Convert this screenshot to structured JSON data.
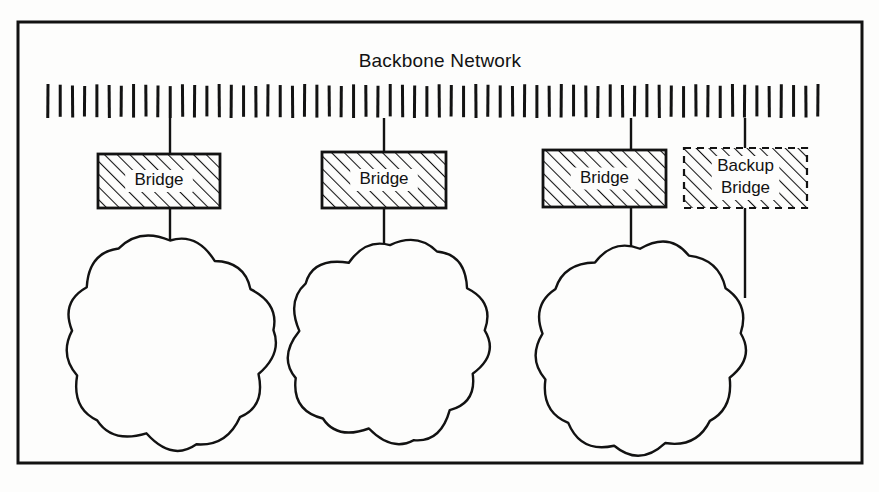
{
  "figure": {
    "title": "Backbone Network",
    "background_color": "#fdfdfc",
    "ink_color": "#121212",
    "frame": {
      "name": "outer-border",
      "x": 18,
      "y": 22,
      "width": 844,
      "height": 441,
      "stroke_width": 3
    }
  },
  "backbone": {
    "label": "Backbone Network",
    "name": "backbone-network-bar",
    "x": 48,
    "y": 84,
    "width": 770,
    "height": 34,
    "tick_count": 64,
    "tick_width": 3,
    "style": "vertical-hatch-band"
  },
  "bridges": [
    {
      "id": "bridge-1",
      "label": "Bridge",
      "lines": [
        "Bridge"
      ],
      "kind": "primary",
      "border": "solid",
      "fill": "diagonal-hatch",
      "x": 98,
      "y": 154,
      "width": 122,
      "height": 54,
      "uplink_x": 170,
      "downlink_x": 170
    },
    {
      "id": "bridge-2",
      "label": "Bridge",
      "lines": [
        "Bridge"
      ],
      "kind": "primary",
      "border": "solid",
      "fill": "diagonal-hatch",
      "x": 322,
      "y": 152,
      "width": 124,
      "height": 56,
      "uplink_x": 384,
      "downlink_x": 384
    },
    {
      "id": "bridge-3",
      "label": "Bridge",
      "lines": [
        "Bridge"
      ],
      "kind": "primary",
      "border": "solid",
      "fill": "diagonal-hatch",
      "x": 543,
      "y": 150,
      "width": 123,
      "height": 57,
      "uplink_x": 631,
      "downlink_x": 631
    },
    {
      "id": "backup-bridge",
      "label": "Backup Bridge",
      "lines": [
        "Backup",
        "Bridge"
      ],
      "kind": "backup",
      "border": "dashed",
      "fill": "diagonal-hatch",
      "x": 684,
      "y": 148,
      "width": 123,
      "height": 60,
      "uplink_x": 745,
      "downlink_x": 745
    }
  ],
  "clouds": [
    {
      "id": "cloud-1",
      "name": "network-cloud-1",
      "cx": 170,
      "cy": 342,
      "rx": 105,
      "ry": 100,
      "connected_bridges": [
        "bridge-1"
      ]
    },
    {
      "id": "cloud-2",
      "name": "network-cloud-2",
      "cx": 390,
      "cy": 342,
      "rx": 97,
      "ry": 98,
      "connected_bridges": [
        "bridge-2"
      ]
    },
    {
      "id": "cloud-3",
      "name": "network-cloud-3",
      "cx": 640,
      "cy": 345,
      "rx": 104,
      "ry": 100,
      "connected_bridges": [
        "bridge-3",
        "backup-bridge"
      ]
    }
  ],
  "links": [
    {
      "id": "link-backbone-bridge-1",
      "from": "backbone",
      "to": "bridge-1",
      "x1": 170,
      "y1": 118,
      "x2": 170,
      "y2": 154
    },
    {
      "id": "link-bridge-1-cloud-1",
      "from": "bridge-1",
      "to": "cloud-1",
      "x1": 170,
      "y1": 208,
      "x2": 170,
      "y2": 254
    },
    {
      "id": "link-backbone-bridge-2",
      "from": "backbone",
      "to": "bridge-2",
      "x1": 384,
      "y1": 118,
      "x2": 384,
      "y2": 152
    },
    {
      "id": "link-bridge-2-cloud-2",
      "from": "bridge-2",
      "to": "cloud-2",
      "x1": 384,
      "y1": 208,
      "x2": 384,
      "y2": 262
    },
    {
      "id": "link-backbone-bridge-3",
      "from": "backbone",
      "to": "bridge-3",
      "x1": 631,
      "y1": 118,
      "x2": 631,
      "y2": 150
    },
    {
      "id": "link-bridge-3-cloud-3",
      "from": "bridge-3",
      "to": "cloud-3",
      "x1": 631,
      "y1": 207,
      "x2": 631,
      "y2": 280
    },
    {
      "id": "link-backbone-backup-bridge",
      "from": "backbone",
      "to": "backup-bridge",
      "x1": 745,
      "y1": 118,
      "x2": 745,
      "y2": 148
    },
    {
      "id": "link-backup-bridge-cloud-3",
      "from": "backup-bridge",
      "to": "cloud-3",
      "x1": 745,
      "y1": 208,
      "x2": 745,
      "y2": 298
    }
  ]
}
